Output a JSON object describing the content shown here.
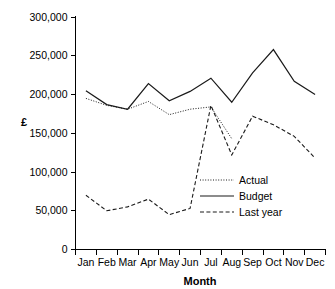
{
  "chart_data": {
    "type": "line",
    "title": "",
    "xlabel": "Month",
    "ylabel": "£",
    "categories": [
      "Jan",
      "Feb",
      "Mar",
      "Apr",
      "May",
      "Jun",
      "Jul",
      "Aug",
      "Sep",
      "Oct",
      "Nov",
      "Dec"
    ],
    "ylim": [
      0,
      300000
    ],
    "yticks": [
      0,
      50000,
      100000,
      150000,
      200000,
      250000,
      300000
    ],
    "ytick_labels": [
      "0",
      "50,000",
      "100,000",
      "150,000",
      "200,000",
      "250,000",
      "300,000"
    ],
    "grid": false,
    "legend_position": "inside-right-lower",
    "series": [
      {
        "name": "Actual",
        "style": "dotted",
        "color": "#1a1a1a",
        "values": [
          195000,
          186000,
          181000,
          191000,
          174000,
          181000,
          184000,
          143000,
          null,
          null,
          null,
          null
        ]
      },
      {
        "name": "Budget",
        "style": "solid",
        "color": "#1a1a1a",
        "values": [
          205000,
          187000,
          181000,
          214000,
          192000,
          204000,
          221000,
          190000,
          228000,
          258000,
          217000,
          200000
        ]
      },
      {
        "name": "Last year",
        "style": "dashed",
        "color": "#1a1a1a",
        "values": [
          70000,
          50000,
          55000,
          65000,
          45000,
          53000,
          186000,
          122000,
          172000,
          161000,
          146000,
          118000
        ]
      }
    ]
  },
  "legend": {
    "entries": [
      {
        "label": "Actual"
      },
      {
        "label": "Budget"
      },
      {
        "label": "Last year"
      }
    ]
  },
  "axes": {
    "x_title": "Month",
    "y_title": "£"
  }
}
